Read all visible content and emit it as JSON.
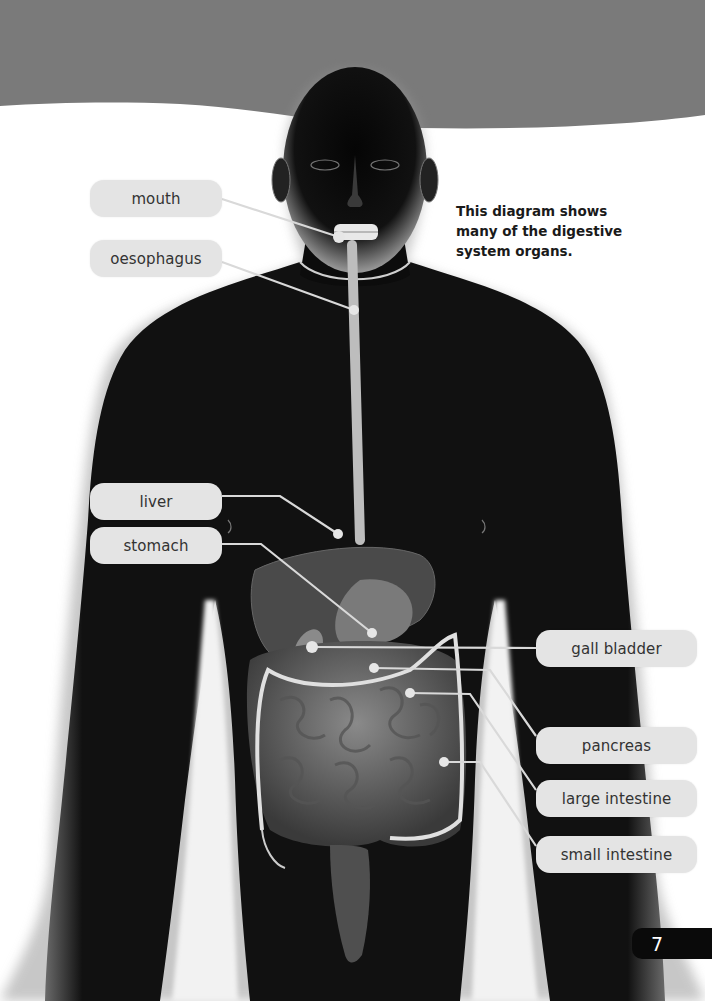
{
  "page": {
    "caption": [
      "This diagram shows",
      "many of the digestive",
      "system organs."
    ],
    "page_number": "7",
    "colors": {
      "banner_gray": "#7a7a7a",
      "label_bg": "#e4e4e4",
      "label_text": "#333333",
      "leader_line": "#d9d9d9",
      "page_tab_bg": "#0a0a0a"
    }
  },
  "labels": {
    "mouth": "mouth",
    "oesophagus": "oesophagus",
    "liver": "liver",
    "stomach": "stomach",
    "gall_bladder": "gall bladder",
    "pancreas": "pancreas",
    "large_intestine": "large intestine",
    "small_intestine": "small intestine"
  }
}
